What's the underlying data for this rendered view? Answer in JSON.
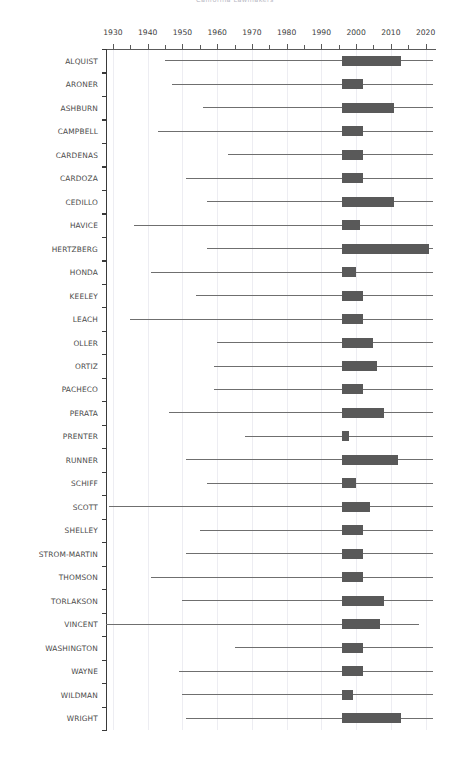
{
  "chart_data": {
    "type": "boxplot",
    "title": "California Lawmakers",
    "xlabel": "",
    "ylabel": "",
    "xlim": [
      1928,
      2023
    ],
    "xticks": [
      1930,
      1940,
      1950,
      1960,
      1970,
      1980,
      1990,
      2000,
      2010,
      2020
    ],
    "xtick_labels": [
      "1930",
      "1940",
      "1950",
      "1960",
      "1970",
      "1980",
      "1990",
      "2000",
      "2010",
      "2020"
    ],
    "xtick_minor_step": 5,
    "grid": "vertical",
    "legend": "none",
    "orientation": "horizontal",
    "box_color": "#595959",
    "whisker_color": "#6f6f6f",
    "grid_color": "#ededf2",
    "axis_color": "#3a3a3a",
    "categories": [
      "ALQUIST",
      "ARONER",
      "ASHBURN",
      "CAMPBELL",
      "CARDENAS",
      "CARDOZA",
      "CEDILLO",
      "HAVICE",
      "HERTZBERG",
      "HONDA",
      "KEELEY",
      "LEACH",
      "OLLER",
      "ORTIZ",
      "PACHECO",
      "PERATA",
      "PRENTER",
      "RUNNER",
      "SCHIFF",
      "SCOTT",
      "SHELLEY",
      "STROM-MARTIN",
      "THOMSON",
      "TORLAKSON",
      "VINCENT",
      "WASHINGTON",
      "WAYNE",
      "WILDMAN",
      "WRIGHT"
    ],
    "boxes": [
      {
        "name": "ALQUIST",
        "whisker_low": 1945,
        "q1": 1996,
        "q3": 2013,
        "whisker_high": 2022
      },
      {
        "name": "ARONER",
        "whisker_low": 1947,
        "q1": 1996,
        "q3": 2002,
        "whisker_high": 2022
      },
      {
        "name": "ASHBURN",
        "whisker_low": 1956,
        "q1": 1996,
        "q3": 2011,
        "whisker_high": 2022
      },
      {
        "name": "CAMPBELL",
        "whisker_low": 1943,
        "q1": 1996,
        "q3": 2002,
        "whisker_high": 2022
      },
      {
        "name": "CARDENAS",
        "whisker_low": 1963,
        "q1": 1996,
        "q3": 2002,
        "whisker_high": 2022
      },
      {
        "name": "CARDOZA",
        "whisker_low": 1951,
        "q1": 1996,
        "q3": 2002,
        "whisker_high": 2022
      },
      {
        "name": "CEDILLO",
        "whisker_low": 1957,
        "q1": 1996,
        "q3": 2011,
        "whisker_high": 2022
      },
      {
        "name": "HAVICE",
        "whisker_low": 1936,
        "q1": 1996,
        "q3": 2001,
        "whisker_high": 2022
      },
      {
        "name": "HERTZBERG",
        "whisker_low": 1957,
        "q1": 1996,
        "q3": 2021,
        "whisker_high": 2022
      },
      {
        "name": "HONDA",
        "whisker_low": 1941,
        "q1": 1996,
        "q3": 2000,
        "whisker_high": 2022
      },
      {
        "name": "KEELEY",
        "whisker_low": 1954,
        "q1": 1996,
        "q3": 2002,
        "whisker_high": 2022
      },
      {
        "name": "LEACH",
        "whisker_low": 1935,
        "q1": 1996,
        "q3": 2002,
        "whisker_high": 2022
      },
      {
        "name": "OLLER",
        "whisker_low": 1960,
        "q1": 1996,
        "q3": 2005,
        "whisker_high": 2022
      },
      {
        "name": "ORTIZ",
        "whisker_low": 1959,
        "q1": 1996,
        "q3": 2006,
        "whisker_high": 2022
      },
      {
        "name": "PACHECO",
        "whisker_low": 1959,
        "q1": 1996,
        "q3": 2002,
        "whisker_high": 2022
      },
      {
        "name": "PERATA",
        "whisker_low": 1946,
        "q1": 1996,
        "q3": 2008,
        "whisker_high": 2022
      },
      {
        "name": "PRENTER",
        "whisker_low": 1968,
        "q1": 1996,
        "q3": 1998,
        "whisker_high": 2022
      },
      {
        "name": "RUNNER",
        "whisker_low": 1951,
        "q1": 1996,
        "q3": 2012,
        "whisker_high": 2022
      },
      {
        "name": "SCHIFF",
        "whisker_low": 1957,
        "q1": 1996,
        "q3": 2000,
        "whisker_high": 2022
      },
      {
        "name": "SCOTT",
        "whisker_low": 1929,
        "q1": 1996,
        "q3": 2004,
        "whisker_high": 2022
      },
      {
        "name": "SHELLEY",
        "whisker_low": 1955,
        "q1": 1996,
        "q3": 2002,
        "whisker_high": 2022
      },
      {
        "name": "STROM-MARTIN",
        "whisker_low": 1951,
        "q1": 1996,
        "q3": 2002,
        "whisker_high": 2022
      },
      {
        "name": "THOMSON",
        "whisker_low": 1941,
        "q1": 1996,
        "q3": 2002,
        "whisker_high": 2022
      },
      {
        "name": "TORLAKSON",
        "whisker_low": 1950,
        "q1": 1996,
        "q3": 2008,
        "whisker_high": 2022
      },
      {
        "name": "VINCENT",
        "whisker_low": 1928,
        "q1": 1996,
        "q3": 2007,
        "whisker_high": 2018
      },
      {
        "name": "WASHINGTON",
        "whisker_low": 1965,
        "q1": 1996,
        "q3": 2002,
        "whisker_high": 2022
      },
      {
        "name": "WAYNE",
        "whisker_low": 1949,
        "q1": 1996,
        "q3": 2002,
        "whisker_high": 2022
      },
      {
        "name": "WILDMAN",
        "whisker_low": 1950,
        "q1": 1996,
        "q3": 1999,
        "whisker_high": 2022
      },
      {
        "name": "WRIGHT",
        "whisker_low": 1951,
        "q1": 1996,
        "q3": 2013,
        "whisker_high": 2022
      }
    ]
  }
}
